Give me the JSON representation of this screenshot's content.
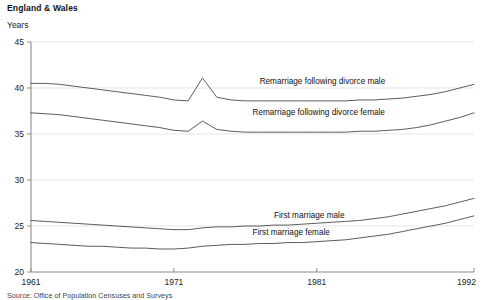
{
  "header": {
    "title": "England & Wales",
    "units_label": "Years"
  },
  "source": {
    "note": "Source: Office of Population Censuses and Surveys"
  },
  "chart_data": {
    "type": "line",
    "title": "England & Wales",
    "subtitle": "Years",
    "xlabel": "",
    "ylabel": "Years",
    "xlim": [
      1961,
      1992
    ],
    "ylim": [
      20,
      45
    ],
    "grid": true,
    "legend_position": "inline-labels",
    "yticks": [
      20,
      25,
      30,
      35,
      40,
      45
    ],
    "ytick_labels": [
      "20",
      "25",
      "30",
      "35",
      "40",
      "45"
    ],
    "xticks": [
      1961,
      1971,
      1981,
      1992
    ],
    "xtick_labels": [
      "1961",
      "1971",
      "1981",
      "1992"
    ],
    "x": [
      1961,
      1962,
      1963,
      1964,
      1965,
      1966,
      1967,
      1968,
      1969,
      1970,
      1971,
      1972,
      1973,
      1974,
      1975,
      1976,
      1977,
      1978,
      1979,
      1980,
      1981,
      1982,
      1983,
      1984,
      1985,
      1986,
      1987,
      1988,
      1989,
      1990,
      1991,
      1992
    ],
    "series": [
      {
        "name": "Remarriage following divorce male",
        "label": "Remarriage following divorce male",
        "label_x": 1977.0,
        "label_y": 40.4,
        "values": [
          40.5,
          40.5,
          40.4,
          40.2,
          40.0,
          39.8,
          39.6,
          39.4,
          39.2,
          39.0,
          38.7,
          38.6,
          41.1,
          39.0,
          38.7,
          38.6,
          38.6,
          38.6,
          38.6,
          38.6,
          38.6,
          38.6,
          38.6,
          38.7,
          38.7,
          38.8,
          38.9,
          39.1,
          39.3,
          39.6,
          40.0,
          40.4
        ]
      },
      {
        "name": "Remarriage following divorce female",
        "label": "Remarriage following divorce female",
        "label_x": 1976.5,
        "label_y": 37.1,
        "values": [
          37.3,
          37.2,
          37.1,
          36.9,
          36.7,
          36.5,
          36.3,
          36.1,
          35.9,
          35.7,
          35.4,
          35.3,
          36.4,
          35.5,
          35.3,
          35.2,
          35.2,
          35.2,
          35.2,
          35.2,
          35.2,
          35.2,
          35.2,
          35.3,
          35.3,
          35.4,
          35.5,
          35.7,
          36.0,
          36.4,
          36.8,
          37.3
        ]
      },
      {
        "name": "First marriage male",
        "label": "First marriage male",
        "label_x": 1978.0,
        "label_y": 25.9,
        "values": [
          25.6,
          25.5,
          25.4,
          25.3,
          25.2,
          25.1,
          25.0,
          24.9,
          24.8,
          24.7,
          24.6,
          24.6,
          24.8,
          24.9,
          24.9,
          25.0,
          25.0,
          25.1,
          25.1,
          25.2,
          25.3,
          25.4,
          25.5,
          25.6,
          25.8,
          26.0,
          26.3,
          26.6,
          26.9,
          27.2,
          27.6,
          28.0
        ]
      },
      {
        "name": "First marriage female",
        "label": "First marriage female",
        "label_x": 1976.5,
        "label_y": 24.0,
        "values": [
          23.2,
          23.1,
          23.0,
          22.9,
          22.8,
          22.8,
          22.7,
          22.6,
          22.6,
          22.5,
          22.5,
          22.6,
          22.8,
          22.9,
          23.0,
          23.0,
          23.1,
          23.1,
          23.2,
          23.2,
          23.3,
          23.4,
          23.5,
          23.7,
          23.9,
          24.1,
          24.4,
          24.7,
          25.0,
          25.3,
          25.7,
          26.1
        ]
      }
    ]
  },
  "colors": {
    "line": "#4a4a4a",
    "grid": "#d8d8d8",
    "axis": "#8c8c8c",
    "text": "#111111",
    "background": "#ffffff"
  }
}
